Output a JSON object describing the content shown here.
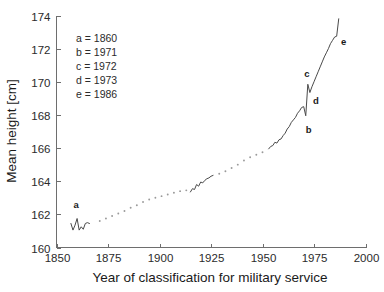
{
  "chart_data": {
    "type": "line",
    "title": "",
    "xlabel": "Year of classification for military service",
    "ylabel": "Mean height [cm]",
    "xlim": [
      1850,
      2000
    ],
    "ylim": [
      160,
      174
    ],
    "xticks": [
      1850,
      1875,
      1900,
      1925,
      1950,
      1975,
      2000
    ],
    "yticks": [
      160,
      162,
      164,
      166,
      168,
      170,
      172,
      174
    ],
    "xtick_labels": [
      "1850",
      "1875",
      "1900",
      "1925",
      "1950",
      "1975",
      "2000"
    ],
    "ytick_labels": [
      "160",
      "162",
      "164",
      "166",
      "168",
      "170",
      "172",
      "174"
    ],
    "grid": false,
    "legend_position": "upper-left-inside",
    "legend_entries": [
      "a = 1860",
      "b = 1971",
      "c = 1972",
      "d = 1973",
      "e = 1986"
    ],
    "annotations": [
      {
        "label": "a",
        "x": 1860,
        "y": 161.9
      },
      {
        "label": "b",
        "x": 1971,
        "y": 167.7
      },
      {
        "label": "c",
        "x": 1972,
        "y": 170.0
      },
      {
        "label": "d",
        "x": 1973,
        "y": 169.2
      },
      {
        "label": "e",
        "x": 1986,
        "y": 172.5
      }
    ],
    "series": [
      {
        "name": "segment-1-solid",
        "style": "solid",
        "x": [
          1857,
          1858,
          1859,
          1860,
          1861,
          1862,
          1863,
          1864,
          1865,
          1866
        ],
        "values": [
          161.45,
          161.05,
          161.35,
          161.75,
          161.05,
          161.25,
          161.1,
          161.45,
          161.5,
          161.45
        ]
      },
      {
        "name": "segment-2-dotted",
        "style": "dotted",
        "x": [
          1871,
          1874,
          1877,
          1880,
          1883,
          1886,
          1889,
          1892,
          1895,
          1898,
          1901,
          1904,
          1907,
          1910,
          1913
        ],
        "values": [
          161.6,
          161.75,
          161.9,
          162.05,
          162.2,
          162.4,
          162.55,
          162.75,
          162.9,
          163.0,
          163.1,
          163.2,
          163.3,
          163.4,
          163.45
        ]
      },
      {
        "name": "segment-3-solid",
        "style": "solid",
        "x": [
          1915,
          1916,
          1917,
          1918,
          1919,
          1920,
          1921,
          1922,
          1923,
          1924,
          1925,
          1926
        ],
        "values": [
          163.35,
          163.55,
          163.5,
          163.8,
          163.7,
          163.95,
          163.9,
          164.05,
          164.15,
          164.2,
          164.3,
          164.35
        ]
      },
      {
        "name": "segment-4-dotted",
        "style": "dotted",
        "x": [
          1929,
          1932,
          1935,
          1938,
          1941,
          1944,
          1947,
          1950
        ],
        "values": [
          164.45,
          164.6,
          164.8,
          165.0,
          165.25,
          165.45,
          165.6,
          165.75
        ]
      },
      {
        "name": "segment-5-solid",
        "style": "solid",
        "x": [
          1953,
          1954,
          1955,
          1956,
          1957,
          1958,
          1959,
          1960,
          1961,
          1962,
          1963,
          1964,
          1965,
          1966,
          1967,
          1968,
          1969,
          1970,
          1971,
          1972,
          1973,
          1974,
          1975,
          1976,
          1977,
          1978,
          1979,
          1980,
          1981,
          1982,
          1983,
          1984,
          1985,
          1986,
          1987
        ],
        "values": [
          165.95,
          166.1,
          166.15,
          166.35,
          166.3,
          166.5,
          166.55,
          166.75,
          166.9,
          167.15,
          167.3,
          167.55,
          167.7,
          167.85,
          168.1,
          168.25,
          168.45,
          168.5,
          167.95,
          169.85,
          169.35,
          169.7,
          170.0,
          170.3,
          170.6,
          170.9,
          171.2,
          171.5,
          171.75,
          172.0,
          172.3,
          172.5,
          172.7,
          172.75,
          173.8
        ]
      }
    ]
  }
}
